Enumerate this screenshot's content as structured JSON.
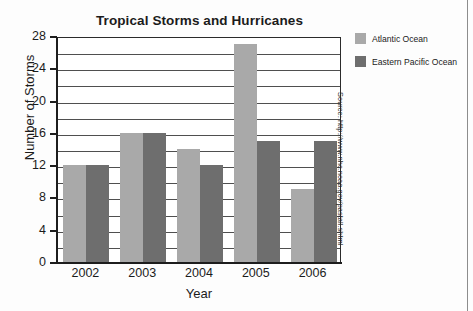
{
  "chart_data": {
    "type": "bar",
    "title": "Tropical Storms and Hurricanes",
    "xlabel": "Year",
    "ylabel": "Number of Storms",
    "categories": [
      "2002",
      "2003",
      "2004",
      "2005",
      "2006"
    ],
    "series": [
      {
        "name": "Atlantic Ocean",
        "color": "#a9a9a9",
        "values": [
          12,
          16,
          14,
          27,
          9
        ]
      },
      {
        "name": "Eastern Pacific Ocean",
        "color": "#6e6e6e",
        "values": [
          12,
          16,
          12,
          15,
          15
        ]
      }
    ],
    "ylim": [
      0,
      28
    ],
    "y_tick_labels": [
      "0",
      "4",
      "8",
      "12",
      "16",
      "20",
      "24",
      "28"
    ],
    "y_tick_values": [
      0,
      4,
      8,
      12,
      16,
      20,
      24,
      28
    ],
    "gridline_values": [
      2,
      4,
      6,
      8,
      10,
      12,
      14,
      16,
      18,
      20,
      22,
      24,
      26
    ],
    "grid": true,
    "legend_position": "right",
    "annotations": [
      "Source: http://www.nhc.noaa.gov/pastall.shtml"
    ]
  },
  "source_note": "Source: http://www.nhc.noaa.gov/pastall.shtml"
}
